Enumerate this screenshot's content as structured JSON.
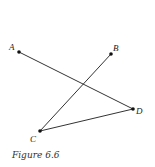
{
  "figure": {
    "caption": "Figure 6.6",
    "points": [
      {
        "name": "A",
        "x": 19,
        "y": 52
      },
      {
        "name": "B",
        "x": 111,
        "y": 54
      },
      {
        "name": "C",
        "x": 40,
        "y": 131
      },
      {
        "name": "D",
        "x": 133,
        "y": 109
      }
    ],
    "segments": [
      [
        "A",
        "D"
      ],
      [
        "B",
        "C"
      ],
      [
        "C",
        "D"
      ]
    ],
    "colors": {
      "line": "#333333",
      "point": "#111111"
    }
  }
}
